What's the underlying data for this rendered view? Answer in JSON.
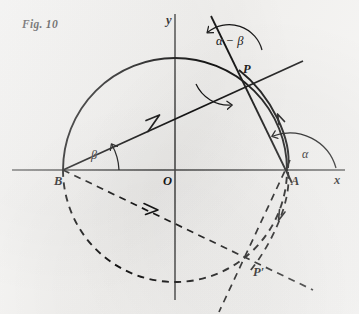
{
  "figure": {
    "caption": "Fig. 10",
    "background_color": "#f3f2f0",
    "ink_color": "#131313"
  },
  "axes": {
    "x_label": "x",
    "y_label": "y",
    "origin_label": "O",
    "origin_px": [
      175,
      170
    ],
    "x_axis_span_px": [
      12,
      345
    ],
    "y_axis_span_px": [
      14,
      300
    ]
  },
  "points": [
    {
      "name": "point-b",
      "label": "B",
      "x": 63,
      "y": 170,
      "label_dx": -9,
      "label_dy": 6
    },
    {
      "name": "point-a",
      "label": "A",
      "x": 288,
      "y": 170,
      "label_dx": 3,
      "label_dy": 6
    },
    {
      "name": "point-o",
      "label": "O",
      "x": 175,
      "y": 170,
      "label_dx": -12,
      "label_dy": 6
    },
    {
      "name": "point-p",
      "label": "P",
      "x": 237,
      "y": 68,
      "label_dx": 6,
      "label_dy": 5
    },
    {
      "name": "point-p-prime",
      "label": "P′",
      "x": 248,
      "y": 272,
      "label_dx": 5,
      "label_dy": 5
    }
  ],
  "angles": [
    {
      "name": "angle-beta",
      "label": "β",
      "at": "B",
      "x": 95,
      "y": 156
    },
    {
      "name": "angle-alpha",
      "label": "α",
      "at": "A",
      "x": 305,
      "y": 155
    },
    {
      "name": "angle-alpha-beta",
      "label": "α − β",
      "at": "P",
      "x": 229,
      "y": 41
    }
  ],
  "curves": {
    "upper_semicircle": {
      "style": "solid",
      "center": [
        175,
        170
      ],
      "radius": 112,
      "from_deg": 180,
      "to_deg": 0
    },
    "lower_semicircle": {
      "style": "dashed",
      "center": [
        175,
        170
      ],
      "radius": 112,
      "from_deg": 180,
      "to_deg": 360
    },
    "arc_a_to_p": {
      "style": "solid",
      "note": "short arc from A up to P"
    },
    "arc_a_to_p_mirror": {
      "style": "dashed",
      "note": "mirrored short arc from A down to P-prime"
    }
  },
  "rays": [
    {
      "name": "ray-b-through-p",
      "style": "solid",
      "from": "B",
      "through": "P",
      "arrow": "toward-P"
    },
    {
      "name": "ray-a-through-p",
      "style": "solid",
      "from": "A",
      "through": "P",
      "arrow": "toward-P"
    },
    {
      "name": "ray-b-through-p-prime",
      "style": "dashed",
      "from": "B",
      "through": "P′",
      "arrow": "toward-P-prime"
    },
    {
      "name": "ray-a-through-p-prime",
      "style": "dashed",
      "from": "A",
      "through": "P′",
      "arrow": "toward-P-prime"
    }
  ]
}
